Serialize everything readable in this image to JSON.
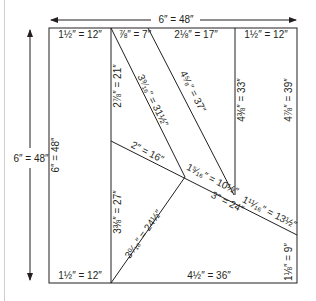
{
  "diagram": {
    "overall_width": "6″ = 48″",
    "overall_height": "6″ = 48″",
    "left_edge_label": "6″ = 48″",
    "top_labels": [
      "1½″ = 12″",
      "⅞″ = 7″",
      "2⅛″ = 17″",
      "1½″ = 12″"
    ],
    "bottom_labels": [
      "1½″ = 12″",
      "4½″ = 36″"
    ],
    "inner_labels": {
      "left_upper_vertical": "2⅞″ = 21″",
      "left_lower_vertical": "3⅜″ = 27″",
      "diagonal_a": "3⁹⁄₁₆″ = 31½″",
      "diagonal_b": "4⁵⁄₈″ = 37″",
      "short_slant": "2″ = 16″",
      "slant_mid": "1⁵⁄₁₆″ = 10½″",
      "slant_long": "3″ = 24″",
      "slant_right": "1¹¹⁄₁₆″ = 13½″",
      "bottom_diagonal": "3⁰⁄₁₆″ = 24½″",
      "right_inner_vertical": "4⅜″ = 33″",
      "right_edge_upper": "4⅞″ = 39″",
      "right_edge_lower": "1⅛″ = 9″"
    },
    "line_color": "#231f20"
  }
}
